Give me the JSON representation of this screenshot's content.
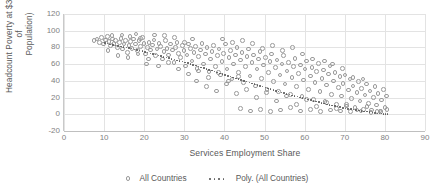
{
  "chart_data": {
    "type": "scatter",
    "title": "",
    "xlabel": "Services Employment Share",
    "ylabel": "Headcount Poverty at $3.20 (% of Population)",
    "ylabel_line1": "Headcount Poverty at $3.20 (% of",
    "ylabel_line2": "Population)",
    "xlim": [
      0,
      90
    ],
    "ylim": [
      -20,
      120
    ],
    "xticks": [
      0,
      10,
      20,
      30,
      40,
      50,
      60,
      70,
      80,
      90
    ],
    "yticks": [
      -20,
      0,
      20,
      40,
      60,
      80,
      100,
      120
    ],
    "grid": true,
    "legend_position": "bottom",
    "marker_color": "#9a9a9a",
    "trendline_color": "#595959",
    "series": [
      {
        "name": "All Countries",
        "type": "scatter",
        "points": [
          [
            7.5,
            88
          ],
          [
            8.2,
            90
          ],
          [
            8.8,
            86
          ],
          [
            9.4,
            92
          ],
          [
            9.9,
            84
          ],
          [
            10.3,
            89
          ],
          [
            10.8,
            93
          ],
          [
            11.2,
            87
          ],
          [
            11.6,
            82
          ],
          [
            12.1,
            90
          ],
          [
            12.5,
            85
          ],
          [
            12.9,
            88
          ],
          [
            13.3,
            80
          ],
          [
            13.8,
            86
          ],
          [
            14.2,
            91
          ],
          [
            14.6,
            78
          ],
          [
            15.0,
            84
          ],
          [
            15.4,
            88
          ],
          [
            15.8,
            74
          ],
          [
            16.2,
            82
          ],
          [
            16.6,
            87
          ],
          [
            17.0,
            79
          ],
          [
            17.4,
            90
          ],
          [
            17.9,
            84
          ],
          [
            18.3,
            76
          ],
          [
            18.7,
            88
          ],
          [
            19.1,
            81
          ],
          [
            19.5,
            92
          ],
          [
            19.9,
            85
          ],
          [
            20.3,
            72
          ],
          [
            20.8,
            80
          ],
          [
            21.2,
            86
          ],
          [
            21.6,
            77
          ],
          [
            22.0,
            83
          ],
          [
            22.4,
            89
          ],
          [
            22.8,
            70
          ],
          [
            23.2,
            78
          ],
          [
            23.7,
            85
          ],
          [
            24.1,
            81
          ],
          [
            24.5,
            66
          ],
          [
            24.9,
            75
          ],
          [
            25.3,
            88
          ],
          [
            25.7,
            79
          ],
          [
            26.1,
            71
          ],
          [
            26.6,
            84
          ],
          [
            27.0,
            77
          ],
          [
            27.4,
            62
          ],
          [
            27.8,
            80
          ],
          [
            28.2,
            86
          ],
          [
            28.6,
            73
          ],
          [
            29.0,
            68
          ],
          [
            29.5,
            82
          ],
          [
            29.9,
            76
          ],
          [
            30.3,
            58
          ],
          [
            30.7,
            71
          ],
          [
            31.1,
            84
          ],
          [
            31.5,
            79
          ],
          [
            31.9,
            64
          ],
          [
            32.4,
            74
          ],
          [
            32.8,
            81
          ],
          [
            33.2,
            55
          ],
          [
            33.6,
            69
          ],
          [
            34.0,
            77
          ],
          [
            34.4,
            85
          ],
          [
            34.8,
            60
          ],
          [
            35.3,
            72
          ],
          [
            35.7,
            80
          ],
          [
            36.1,
            51
          ],
          [
            36.5,
            66
          ],
          [
            36.9,
            75
          ],
          [
            37.3,
            82
          ],
          [
            37.7,
            57
          ],
          [
            38.2,
            70
          ],
          [
            38.6,
            78
          ],
          [
            39.0,
            47
          ],
          [
            39.4,
            63
          ],
          [
            39.8,
            73
          ],
          [
            40.2,
            84
          ],
          [
            40.6,
            54
          ],
          [
            41.1,
            68
          ],
          [
            41.5,
            76
          ],
          [
            41.9,
            42
          ],
          [
            42.3,
            60
          ],
          [
            42.7,
            71
          ],
          [
            43.1,
            80
          ],
          [
            43.5,
            50
          ],
          [
            44.0,
            65
          ],
          [
            44.4,
            74
          ],
          [
            44.8,
            38
          ],
          [
            45.2,
            57
          ],
          [
            45.6,
            69
          ],
          [
            46.0,
            78
          ],
          [
            46.4,
            46
          ],
          [
            46.9,
            62
          ],
          [
            47.3,
            71
          ],
          [
            47.7,
            34
          ],
          [
            48.1,
            54
          ],
          [
            48.5,
            66
          ],
          [
            48.9,
            75
          ],
          [
            49.3,
            43
          ],
          [
            49.8,
            59
          ],
          [
            50.2,
            68
          ],
          [
            50.6,
            30
          ],
          [
            51.0,
            50
          ],
          [
            51.4,
            63
          ],
          [
            51.8,
            72
          ],
          [
            52.2,
            39
          ],
          [
            52.7,
            56
          ],
          [
            53.1,
            65
          ],
          [
            53.5,
            27
          ],
          [
            53.9,
            47
          ],
          [
            54.3,
            60
          ],
          [
            54.7,
            70
          ],
          [
            55.1,
            36
          ],
          [
            55.6,
            52
          ],
          [
            56.0,
            62
          ],
          [
            56.4,
            24
          ],
          [
            56.8,
            44
          ],
          [
            57.2,
            57
          ],
          [
            57.6,
            67
          ],
          [
            58.0,
            33
          ],
          [
            58.5,
            49
          ],
          [
            58.9,
            59
          ],
          [
            59.3,
            21
          ],
          [
            59.7,
            41
          ],
          [
            60.1,
            54
          ],
          [
            60.5,
            64
          ],
          [
            60.9,
            30
          ],
          [
            61.4,
            46
          ],
          [
            61.8,
            56
          ],
          [
            62.2,
            18
          ],
          [
            62.6,
            38
          ],
          [
            63.0,
            51
          ],
          [
            63.4,
            61
          ],
          [
            63.8,
            27
          ],
          [
            64.3,
            43
          ],
          [
            64.7,
            53
          ],
          [
            65.1,
            15
          ],
          [
            65.5,
            35
          ],
          [
            65.9,
            48
          ],
          [
            66.3,
            58
          ],
          [
            66.7,
            24
          ],
          [
            67.2,
            40
          ],
          [
            67.6,
            50
          ],
          [
            68.0,
            12
          ],
          [
            68.4,
            32
          ],
          [
            68.8,
            45
          ],
          [
            69.2,
            22
          ],
          [
            69.6,
            37
          ],
          [
            70.1,
            47
          ],
          [
            70.5,
            10
          ],
          [
            70.9,
            29
          ],
          [
            71.3,
            42
          ],
          [
            71.7,
            19
          ],
          [
            72.1,
            34
          ],
          [
            72.5,
            8
          ],
          [
            73.0,
            26
          ],
          [
            73.4,
            39
          ],
          [
            73.8,
            16
          ],
          [
            74.2,
            31
          ],
          [
            74.6,
            6
          ],
          [
            75.0,
            23
          ],
          [
            75.4,
            36
          ],
          [
            75.9,
            13
          ],
          [
            76.3,
            28
          ],
          [
            76.7,
            5
          ],
          [
            77.1,
            20
          ],
          [
            77.5,
            33
          ],
          [
            77.9,
            11
          ],
          [
            78.3,
            25
          ],
          [
            78.8,
            4
          ],
          [
            79.2,
            17
          ],
          [
            79.6,
            30
          ],
          [
            80.0,
            8
          ],
          [
            80.4,
            22
          ],
          [
            33.0,
            40
          ],
          [
            35.5,
            33
          ],
          [
            38.0,
            28
          ],
          [
            40.5,
            36
          ],
          [
            43.0,
            25
          ],
          [
            45.5,
            30
          ],
          [
            48.0,
            20
          ],
          [
            50.5,
            26
          ],
          [
            53.0,
            16
          ],
          [
            55.5,
            22
          ],
          [
            58.0,
            12
          ],
          [
            60.5,
            18
          ],
          [
            63.0,
            9
          ],
          [
            65.5,
            14
          ],
          [
            68.0,
            7
          ],
          [
            70.5,
            12
          ],
          [
            73.0,
            5
          ],
          [
            75.5,
            9
          ],
          [
            78.0,
            3
          ],
          [
            80.5,
            6
          ],
          [
            44.0,
            7
          ],
          [
            46.5,
            4
          ],
          [
            49.0,
            6
          ],
          [
            51.5,
            3
          ],
          [
            54.0,
            5
          ],
          [
            56.5,
            8
          ],
          [
            59.0,
            4
          ],
          [
            61.5,
            6
          ],
          [
            64.0,
            3
          ],
          [
            66.5,
            5
          ],
          [
            69.0,
            4
          ],
          [
            71.5,
            3
          ],
          [
            74.0,
            4
          ],
          [
            76.5,
            2
          ],
          [
            79.0,
            3
          ],
          [
            21.0,
            66
          ],
          [
            23.5,
            58
          ],
          [
            26.0,
            62
          ],
          [
            28.5,
            54
          ],
          [
            31.0,
            48
          ],
          [
            33.5,
            52
          ],
          [
            36.0,
            44
          ],
          [
            38.5,
            50
          ],
          [
            41.0,
            40
          ],
          [
            43.5,
            45
          ],
          [
            11.0,
            76
          ],
          [
            13.5,
            70
          ],
          [
            16.0,
            68
          ],
          [
            18.5,
            72
          ],
          [
            20.5,
            60
          ],
          [
            12.0,
            94
          ],
          [
            14.5,
            95
          ],
          [
            16.5,
            93
          ],
          [
            18.0,
            96
          ],
          [
            19.0,
            91
          ],
          [
            57.0,
            80
          ],
          [
            59.5,
            72
          ],
          [
            62.0,
            66
          ],
          [
            54.5,
            76
          ],
          [
            52.0,
            82
          ],
          [
            47.0,
            85
          ],
          [
            49.5,
            79
          ],
          [
            44.5,
            88
          ],
          [
            42.0,
            86
          ],
          [
            39.5,
            90
          ],
          [
            65.0,
            64
          ],
          [
            67.0,
            60
          ],
          [
            69.5,
            55
          ],
          [
            72.0,
            44
          ],
          [
            74.5,
            42
          ],
          [
            30.0,
            86
          ],
          [
            32.0,
            90
          ],
          [
            27.5,
            92
          ],
          [
            25.0,
            94
          ],
          [
            22.5,
            95
          ]
        ]
      },
      {
        "name": "Poly. (All Countries)",
        "type": "poly-trendline",
        "points": [
          [
            10,
            86
          ],
          [
            14,
            82
          ],
          [
            18,
            78
          ],
          [
            22,
            73
          ],
          [
            26,
            68
          ],
          [
            30,
            63
          ],
          [
            34,
            57
          ],
          [
            38,
            51
          ],
          [
            42,
            45
          ],
          [
            46,
            39
          ],
          [
            50,
            33
          ],
          [
            54,
            27
          ],
          [
            58,
            22
          ],
          [
            62,
            17
          ],
          [
            66,
            12
          ],
          [
            70,
            8
          ],
          [
            74,
            5
          ],
          [
            78,
            2
          ],
          [
            81,
            1
          ]
        ]
      }
    ],
    "legend": [
      {
        "label": "All Countries",
        "marker": "open-circle"
      },
      {
        "label": "Poly. (All Countries)",
        "marker": "dotted-line"
      }
    ]
  }
}
